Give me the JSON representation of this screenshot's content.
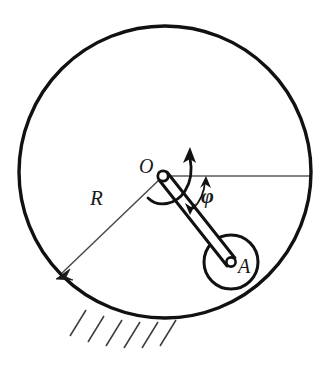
{
  "figure": {
    "type": "mechanics-diagram",
    "background_color": "#ffffff",
    "stroke_color": "#111111",
    "thin_stroke_color": "#555555",
    "labels": {
      "center_point": "O",
      "roller_point": "A",
      "radius": "R",
      "angle": "φ"
    },
    "geometry": {
      "big_circle": {
        "cx": 165,
        "cy": 172,
        "r": 146,
        "stroke_width": 3.4
      },
      "roller_circle": {
        "cx": 231,
        "cy": 262,
        "r": 27,
        "stroke_width": 3.0
      },
      "pivot_joint": {
        "cx": 163,
        "cy": 176,
        "r": 5.2
      },
      "roller_joint": {
        "cx": 231,
        "cy": 262,
        "r": 4.6
      },
      "rod": {
        "x1": 163,
        "y1": 176,
        "x2": 231,
        "y2": 262,
        "half_width": 5.0
      },
      "horizontal_reference_line": {
        "x1": 163,
        "y1": 176,
        "x2": 311,
        "y2": 176
      },
      "radius_dimension": {
        "x1": 163,
        "y1": 176,
        "x2": 58,
        "y2": 277
      },
      "angle_arc_radius": 44,
      "angle_degrees": 51.6,
      "hatch_marks": 6
    },
    "ground_hatching": {
      "present": true,
      "side": "bottom-left",
      "count": 6
    }
  }
}
